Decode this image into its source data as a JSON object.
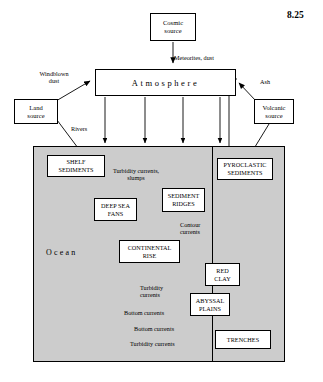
{
  "figure": {
    "number": "8.25",
    "ocean_label": "Ocean",
    "atmosphere_label": "Atmosphere"
  },
  "boxes": [
    {
      "id": "cosmic-source",
      "text": "Cosmic\nsource",
      "x": 150,
      "y": 13,
      "w": 46,
      "h": 28
    },
    {
      "id": "land-source",
      "text": "Land\nsource",
      "x": 14,
      "y": 99,
      "w": 44,
      "h": 25
    },
    {
      "id": "volcanic-source",
      "text": "Volcanic\nsource",
      "x": 254,
      "y": 99,
      "w": 40,
      "h": 25
    },
    {
      "id": "shelf-sediments",
      "text": "SHELF\nSEDIMENTS",
      "x": 47,
      "y": 155,
      "w": 58,
      "h": 22
    },
    {
      "id": "pyroclastic-sediments",
      "text": "PYROCLASTIC\nSEDIMENTS",
      "x": 217,
      "y": 158,
      "w": 56,
      "h": 22
    },
    {
      "id": "sediment-ridges",
      "text": "SEDIMENT\nRIDGES",
      "x": 162,
      "y": 188,
      "w": 43,
      "h": 24
    },
    {
      "id": "deep-sea-fans",
      "text": "DEEP SEA\nFANS",
      "x": 94,
      "y": 198,
      "w": 43,
      "h": 23
    },
    {
      "id": "continental-rise",
      "text": "CONTINENTAL\nRISE",
      "x": 119,
      "y": 240,
      "w": 61,
      "h": 23
    },
    {
      "id": "red-clay",
      "text": "RED\nCLAY",
      "x": 205,
      "y": 263,
      "w": 35,
      "h": 23
    },
    {
      "id": "abyssal-plains",
      "text": "ABYSSAL\nPLAINS",
      "x": 190,
      "y": 293,
      "w": 40,
      "h": 23
    },
    {
      "id": "trenches",
      "text": "TRENCHES",
      "x": 215,
      "y": 330,
      "w": 56,
      "h": 19
    }
  ],
  "labels": [
    {
      "id": "meteorites-dust",
      "text": "Meteorites, dust",
      "x": 174,
      "y": 54,
      "w": 70,
      "align": "left"
    },
    {
      "id": "windblown-dust",
      "text": "Windblown\ndust",
      "x": 26,
      "y": 70,
      "w": 56,
      "align": "center"
    },
    {
      "id": "ash",
      "text": "Ash",
      "x": 260,
      "y": 78,
      "w": 22,
      "align": "left"
    },
    {
      "id": "rivers",
      "text": "Rivers",
      "x": 71,
      "y": 125,
      "w": 30,
      "align": "left"
    },
    {
      "id": "turbidity-slumps",
      "text": "Turbidity currents,\nslumps",
      "x": 102,
      "y": 167,
      "w": 68,
      "align": "center"
    },
    {
      "id": "contour-currents",
      "text": "Contour\ncurrents",
      "x": 180,
      "y": 221,
      "w": 36,
      "align": "left"
    },
    {
      "id": "turbidity-currents-1",
      "text": "Turbidity\ncurrents",
      "x": 140,
      "y": 284,
      "w": 34,
      "align": "left"
    },
    {
      "id": "bottom-currents-1",
      "text": "Bottom currents",
      "x": 124,
      "y": 309,
      "w": 62,
      "align": "left"
    },
    {
      "id": "bottom-currents-2",
      "text": "Bottom currents",
      "x": 134,
      "y": 330,
      "w": 62,
      "align": "left"
    },
    {
      "id": "turbidity-currents-2",
      "text": "Turbidity currents",
      "x": 130,
      "y": 340,
      "w": 70,
      "align": "left"
    }
  ],
  "colors": {
    "ocean_fill": "#cccccc",
    "line": "#000000",
    "box_fill": "#ffffff",
    "page_bg": "#ffffff"
  }
}
